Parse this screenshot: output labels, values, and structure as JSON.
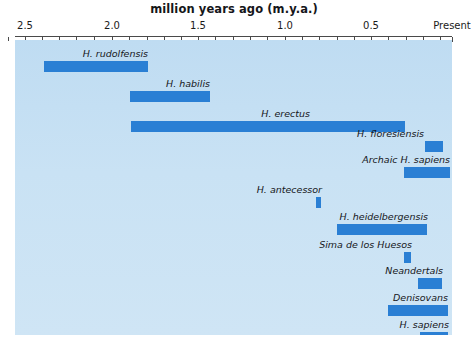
{
  "chart_data": {
    "type": "bar",
    "orientation": "horizontal-range",
    "title": "million years ago (m.y.a.)",
    "xlabel": "million years ago (m.y.a.)",
    "ylabel": "",
    "xlim": [
      2.65,
      0.0
    ],
    "x_reversed": true,
    "grid": false,
    "legend": null,
    "tick_labels": [
      "2.5",
      "2.0",
      "1.5",
      "1.0",
      "0.5",
      "Present"
    ],
    "tick_values": [
      2.5,
      2.0,
      1.5,
      1.0,
      0.5,
      0.0
    ],
    "minor_tick_step": 0.1,
    "bar_color": "#2a7fd4",
    "plot_background": "#c9e2f4",
    "categories": [
      "H. rudolfensis",
      "H. habilis",
      "H. erectus",
      "H. floresiensis",
      "Archaic H. sapiens",
      "H. antecessor",
      "H. heidelbergensis",
      "Sima de los Huesos",
      "Neandertals",
      "Denisovans",
      "H. sapiens"
    ],
    "ranges": [
      {
        "name": "H. rudolfensis",
        "start_mya": 2.39,
        "end_mya": 1.79
      },
      {
        "name": "H. habilis",
        "start_mya": 1.89,
        "end_mya": 1.43
      },
      {
        "name": "H. erectus",
        "start_mya": 1.88,
        "end_mya": 0.3
      },
      {
        "name": "H. floresiensis",
        "start_mya": 0.19,
        "end_mya": 0.08
      },
      {
        "name": "Archaic H. sapiens",
        "start_mya": 0.31,
        "end_mya": 0.04
      },
      {
        "name": "H. antecessor",
        "start_mya": 0.82,
        "end_mya": 0.79
      },
      {
        "name": "H. heidelbergensis",
        "start_mya": 0.7,
        "end_mya": 0.18
      },
      {
        "name": "Sima de los Huesos",
        "start_mya": 0.31,
        "end_mya": 0.27
      },
      {
        "name": "Neandertals",
        "start_mya": 0.23,
        "end_mya": 0.09
      },
      {
        "name": "Denisovans",
        "start_mya": 0.4,
        "end_mya": 0.05
      },
      {
        "name": "H. sapiens",
        "start_mya": 0.21,
        "end_mya": 0.05
      }
    ]
  },
  "chart": {
    "title": "million years ago (m.y.a.)",
    "bars": [
      {
        "label": "H. rudolfensis",
        "x": 44,
        "w": 104,
        "y": 21,
        "label_x": 148,
        "label_y": 8
      },
      {
        "label": "H. habilis",
        "x": 130,
        "w": 80,
        "y": 51,
        "label_x": 210,
        "label_y": 38
      },
      {
        "label": "H. erectus",
        "x": 131,
        "w": 274,
        "y": 81,
        "label_x": 310,
        "label_y": 68
      },
      {
        "label": "H. floresiensis",
        "x": 425,
        "w": 18,
        "y": 101,
        "label_x": 424,
        "label_y": 88
      },
      {
        "label": "Archaic H. sapiens",
        "x": 404,
        "w": 46,
        "y": 127,
        "label_x": 450,
        "label_y": 114
      },
      {
        "label": "H. antecessor",
        "x": 316,
        "w": 5,
        "y": 157,
        "label_x": 322,
        "label_y": 144
      },
      {
        "label": "H. heidelbergensis",
        "x": 337,
        "w": 90,
        "y": 184,
        "label_x": 428,
        "label_y": 171
      },
      {
        "label": "Sima de los Huesos",
        "x": 404,
        "w": 7,
        "y": 212,
        "label_x": 412,
        "label_y": 199
      },
      {
        "label": "Neandertals",
        "x": 418,
        "w": 24,
        "y": 238,
        "label_x": 443,
        "label_y": 225
      },
      {
        "label": "Denisovans",
        "x": 388,
        "w": 60,
        "y": 265,
        "label_x": 448,
        "label_y": 252
      },
      {
        "label": "H. sapiens",
        "x": 420,
        "w": 28,
        "y": 292,
        "label_x": 449,
        "label_y": 279
      }
    ],
    "ticks": [
      {
        "label": "2.5",
        "x": 25
      },
      {
        "label": "2.0",
        "x": 112
      },
      {
        "label": "1.5",
        "x": 198
      },
      {
        "label": "1.0",
        "x": 285
      },
      {
        "label": "0.5",
        "x": 371
      },
      {
        "label": "Present",
        "x": 452
      }
    ],
    "minor_tick_xs": [
      8,
      42,
      59,
      76,
      94,
      129,
      147,
      164,
      181,
      215,
      233,
      250,
      267,
      302,
      319,
      337,
      354,
      388,
      406,
      423,
      440
    ]
  }
}
